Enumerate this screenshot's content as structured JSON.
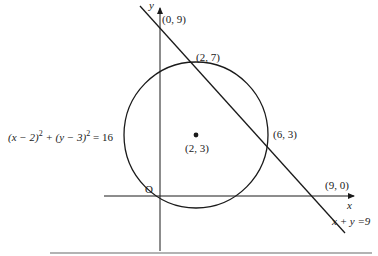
{
  "diagram": {
    "axes": {
      "x_label": "x",
      "y_label": "y",
      "origin_label": "O"
    },
    "circle": {
      "equation_parts": {
        "a": "(x − 2)",
        "sup1": "2",
        "b": " + (y − 3)",
        "sup2": "2",
        "c": " = 16"
      },
      "center_label": "(2, 3)",
      "radius": 4
    },
    "line": {
      "equation": "x + y =9"
    },
    "points": [
      {
        "label": "(0, 9)"
      },
      {
        "label": "(2, 7)"
      },
      {
        "label": "(6, 3)"
      },
      {
        "label": "(9, 0)"
      }
    ],
    "colors": {
      "stroke": "#1a1a1a",
      "rule": "#9a9a9a"
    }
  }
}
